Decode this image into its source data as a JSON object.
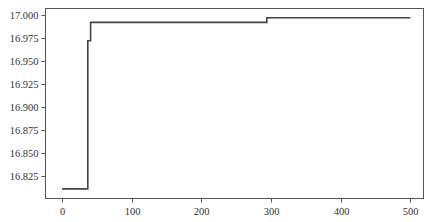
{
  "chart_data": {
    "type": "line",
    "title": "",
    "xlabel": "",
    "ylabel": "",
    "xlim": [
      -24,
      520
    ],
    "ylim": [
      16.8075,
      17.0075
    ],
    "grid": false,
    "legend": null,
    "x_ticks": [
      0,
      100,
      200,
      300,
      400,
      500
    ],
    "x_tick_labels": [
      "0",
      "100",
      "200",
      "300",
      "400",
      "500"
    ],
    "y_ticks": [
      16.825,
      16.85,
      16.875,
      16.9,
      16.925,
      16.95,
      16.975,
      17.0
    ],
    "y_tick_labels": [
      "16.825",
      "16.850",
      "16.875",
      "16.900",
      "16.925",
      "16.950",
      "16.975",
      "17.000"
    ],
    "series": [
      {
        "name": "series-1",
        "color": "#444444",
        "x": [
          0,
          37,
          37,
          41,
          41,
          294,
          294,
          500
        ],
        "y": [
          16.811,
          16.811,
          16.972,
          16.972,
          16.992,
          16.992,
          16.997,
          16.997
        ]
      }
    ]
  },
  "colors": {
    "line": "#444444",
    "axes": "#444444",
    "background": "#ffffff"
  }
}
